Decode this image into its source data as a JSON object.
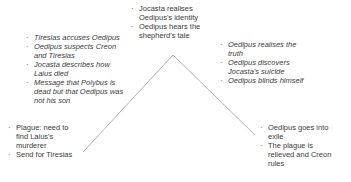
{
  "diagram": {
    "bullet": "·",
    "line_color": "#b2b2b2",
    "text_color": "#3c3c3c",
    "stages": {
      "exposition": {
        "items": [
          "Plague: need to find Laius's murderer",
          "Send for Tiresias"
        ]
      },
      "rising_action": {
        "items": [
          "Tiresias accuses Oedipus",
          "Oedipus suspects Creon and Tiresias",
          "Jocasta describes how Laius died",
          "Message that Polybus is dead but that Oedipus was not his son"
        ]
      },
      "climax": {
        "items": [
          "Jocasta realises Oedipus's identity",
          "Oedipus hears the shepherd's tale"
        ]
      },
      "falling_action": {
        "items": [
          "Oedipus realises the truth",
          "Oedipus discovers Jocasta's suicide",
          "Oedipus blinds himself"
        ]
      },
      "resolution": {
        "items": [
          "Oedipus goes into exile",
          "The plague is relieved and Creon rules"
        ]
      }
    }
  }
}
